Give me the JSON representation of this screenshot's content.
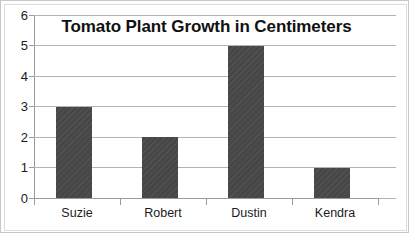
{
  "chart_data": {
    "type": "bar",
    "title": "Tomato Plant Growth in Centimeters",
    "xlabel": "",
    "ylabel": "",
    "categories": [
      "Suzie",
      "Robert",
      "Dustin",
      "Kendra"
    ],
    "values": [
      3,
      2,
      5,
      1
    ],
    "ylim": [
      0,
      6
    ],
    "yticks": [
      0,
      1,
      2,
      3,
      4,
      5,
      6
    ],
    "ytick_labels": [
      "0",
      "1",
      "2",
      "3",
      "4",
      "5",
      "6"
    ],
    "grid": true,
    "legend": false,
    "legend_position": "none",
    "series": [
      {
        "name": "Growth (cm)",
        "values": [
          3,
          2,
          5,
          1
        ]
      }
    ],
    "colors": {
      "bar_fill": "#474747",
      "gridline": "#b3b3b3",
      "axis_line": "#9a9a9a",
      "text": "#1a1a1a",
      "title": "#111111",
      "background": "#ffffff",
      "frame_border": "#c8c8c8"
    }
  }
}
